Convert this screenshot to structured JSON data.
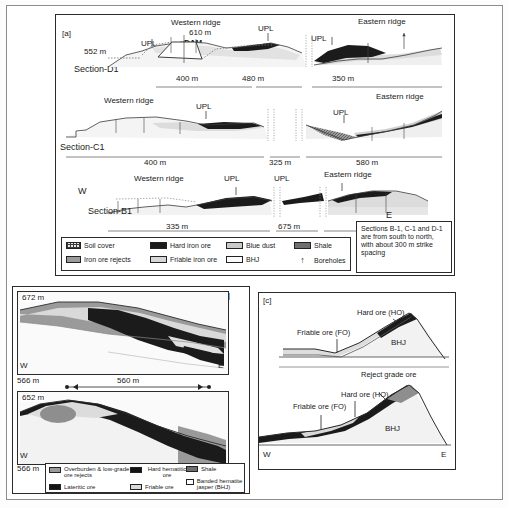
{
  "figure": {
    "panel_a": {
      "tag": "[a]",
      "sections": [
        {
          "name": "Section-D1",
          "elevation_label": "552 m",
          "peak_label": "610 m",
          "dam_label": "DAM",
          "ridge_west": "Western ridge",
          "ridge_east": "Eastern ridge",
          "upl_labels": [
            "UPL",
            "UPL",
            "UPL"
          ],
          "distances": [
            "400 m",
            "480 m",
            "350 m"
          ]
        },
        {
          "name": "Section-C1",
          "ridge_west": "Western ridge",
          "ridge_east": "Eastern ridge",
          "upl_labels": [
            "UPL",
            "UPL"
          ],
          "distances": [
            "400 m",
            "325 m",
            "580 m"
          ]
        },
        {
          "name": "Section-B1",
          "ridge_west": "Western ridge",
          "ridge_east": "Eastern ridge",
          "upl_labels": [
            "UPL",
            "UPL"
          ],
          "distances": [
            "335 m",
            "675 m",
            "320 m"
          ],
          "west_marker": "W",
          "east_marker": "E"
        }
      ],
      "note": "Sections B-1, C-1 and D-1 are from south to north, with about 300 m strike spacing",
      "legend": [
        {
          "label": "Soil cover",
          "swatch": "sw-soil"
        },
        {
          "label": "Iron ore rejects",
          "swatch": "sw-rejects"
        },
        {
          "label": "Hard iron ore",
          "swatch": "sw-hard"
        },
        {
          "label": "Friable iron ore",
          "swatch": "sw-friable"
        },
        {
          "label": "Blue dust",
          "swatch": "sw-blue"
        },
        {
          "label": "BHJ",
          "swatch": "sw-bhj"
        },
        {
          "label": "Shale",
          "swatch": "sw-shale"
        },
        {
          "label": "Boreholes",
          "swatch": "arrow"
        }
      ]
    },
    "panel_b": {
      "tag": "[b]",
      "upper": {
        "top_elevation": "672 m",
        "bottom_elevation": "566 m",
        "west_marker": "W",
        "east_marker": "E",
        "width_label": "560 m"
      },
      "lower": {
        "top_elevation": "652 m",
        "bottom_elevation": "566 m",
        "west_marker": "W",
        "east_marker": "E"
      },
      "legend": [
        {
          "label": "Overburden & low-grade ore rejects",
          "swatch": "sw-overb"
        },
        {
          "label": "Lateritic ore",
          "swatch": "sw-lat"
        },
        {
          "label": "Hard hematitic ore",
          "swatch": "sw-hardhem"
        },
        {
          "label": "Friable ore",
          "swatch": "sw-friable2"
        },
        {
          "label": "Shale",
          "swatch": "sw-shale2"
        },
        {
          "label": "Banded hematite jasper (BHJ)",
          "swatch": "sw-bhj2"
        }
      ]
    },
    "panel_c": {
      "tag": "[c]",
      "upper": {
        "hard_ore": "Hard ore (HO)",
        "friable_ore": "Friable ore (FO)",
        "bhj": "BHJ"
      },
      "lower": {
        "reject_grade_ore": "Reject grade ore",
        "hard_ore": "Hard ore (HO)",
        "friable_ore": "Friable ore (FO)",
        "bhj": "BHJ",
        "west_marker": "W",
        "east_marker": "E"
      }
    }
  },
  "colors": {
    "hard_ore": "#1b1b1b",
    "friable_ore": "#d6d6d6",
    "shale": "#6f6f6f",
    "rejects": "#9a9a9a",
    "bhj": "#f7f7f7",
    "blue_dust": "#c9c9c9",
    "outline": "#2b2b2b"
  }
}
